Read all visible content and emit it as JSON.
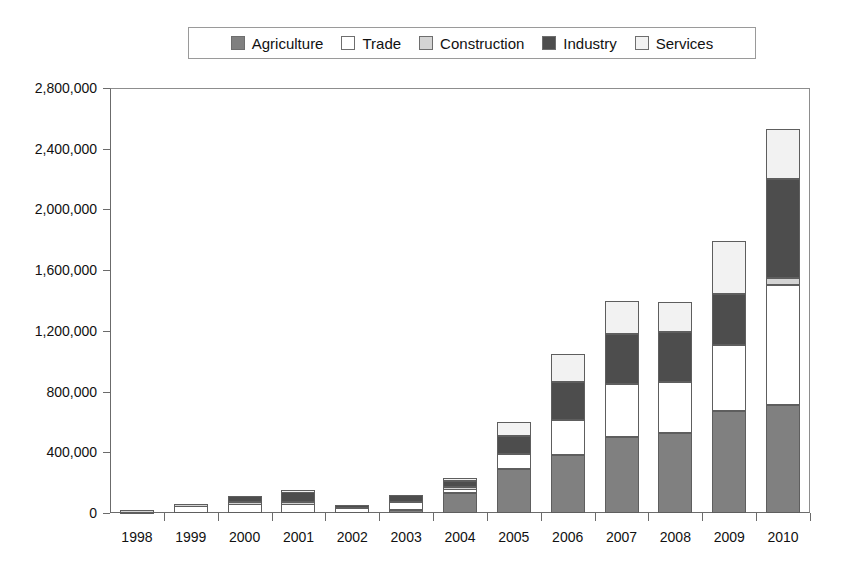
{
  "chart_data": {
    "type": "bar",
    "subtype": "stacked-vertical",
    "title": "",
    "xlabel": "",
    "ylabel": "",
    "categories": [
      "1998",
      "1999",
      "2000",
      "2001",
      "2002",
      "2003",
      "2004",
      "2005",
      "2006",
      "2007",
      "2008",
      "2009",
      "2010"
    ],
    "ylim": [
      0,
      2800000
    ],
    "ytick_labels": [
      "0",
      "400,000",
      "800,000",
      "1,200,000",
      "1,600,000",
      "2,000,000",
      "2,400,000",
      "2,800,000"
    ],
    "ytick_values": [
      0,
      400000,
      800000,
      1200000,
      1600000,
      2000000,
      2400000,
      2800000
    ],
    "grid": false,
    "legend_position": "top",
    "series": [
      {
        "name": "Agriculture",
        "color": "#808080",
        "values": [
          0,
          0,
          0,
          0,
          0,
          20000,
          130000,
          290000,
          380000,
          500000,
          530000,
          670000,
          710000
        ]
      },
      {
        "name": "Trade",
        "color": "#ffffff",
        "values": [
          10000,
          50000,
          60000,
          60000,
          30000,
          50000,
          30000,
          100000,
          230000,
          350000,
          330000,
          440000,
          790000
        ]
      },
      {
        "name": "Construction",
        "color": "#d4d4d4",
        "values": [
          10000,
          10000,
          10000,
          10000,
          0,
          0,
          10000,
          0,
          0,
          0,
          0,
          0,
          50000
        ]
      },
      {
        "name": "Industry",
        "color": "#4d4d4d",
        "values": [
          0,
          0,
          40000,
          70000,
          20000,
          50000,
          40000,
          120000,
          250000,
          330000,
          330000,
          330000,
          650000
        ]
      },
      {
        "name": "Services",
        "color": "#f2f2f2",
        "values": [
          0,
          0,
          0,
          10000,
          0,
          0,
          20000,
          90000,
          190000,
          220000,
          200000,
          350000,
          330000
        ]
      }
    ],
    "totals": [
      20000,
      60000,
      110000,
      150000,
      50000,
      120000,
      230000,
      600000,
      1050000,
      1400000,
      1390000,
      1790000,
      2530000
    ]
  },
  "legend": {
    "items": [
      {
        "label": "Agriculture",
        "swatch": "#808080"
      },
      {
        "label": "Trade",
        "swatch": "#ffffff"
      },
      {
        "label": "Construction",
        "swatch": "#d4d4d4"
      },
      {
        "label": "Industry",
        "swatch": "#4d4d4d"
      },
      {
        "label": "Services",
        "swatch": "#f2f2f2"
      }
    ]
  }
}
